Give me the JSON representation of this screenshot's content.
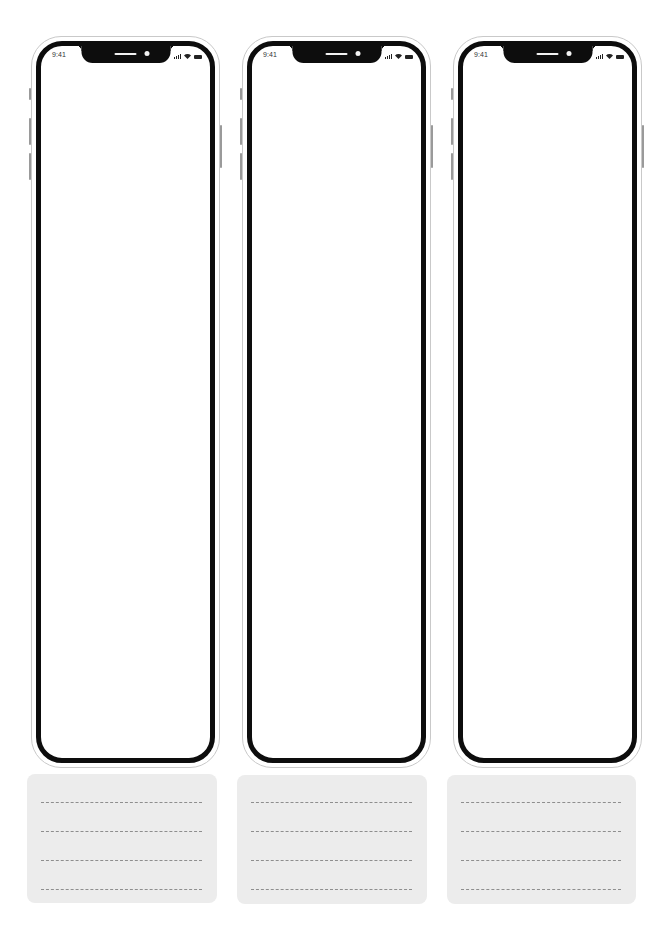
{
  "template": {
    "devices": [
      {
        "id": "phone-1",
        "status_bar": {
          "time": "9:41",
          "icons": [
            "cellular-signal-icon",
            "wifi-icon",
            "battery-icon"
          ]
        },
        "screen": {
          "content": ""
        },
        "notes_card": {
          "line_count": 4
        }
      },
      {
        "id": "phone-2",
        "status_bar": {
          "time": "9:41",
          "icons": [
            "cellular-signal-icon",
            "wifi-icon",
            "battery-icon"
          ]
        },
        "screen": {
          "content": ""
        },
        "notes_card": {
          "line_count": 4
        }
      },
      {
        "id": "phone-3",
        "status_bar": {
          "time": "9:41",
          "icons": [
            "cellular-signal-icon",
            "wifi-icon",
            "battery-icon"
          ]
        },
        "screen": {
          "content": ""
        },
        "notes_card": {
          "line_count": 4
        }
      }
    ],
    "colors": {
      "bezel": "#0d0d0d",
      "shell_outline": "#c9c9c9",
      "screen": "#ffffff",
      "card_background": "#ececec",
      "dashed_line": "#8e8e8e"
    }
  }
}
